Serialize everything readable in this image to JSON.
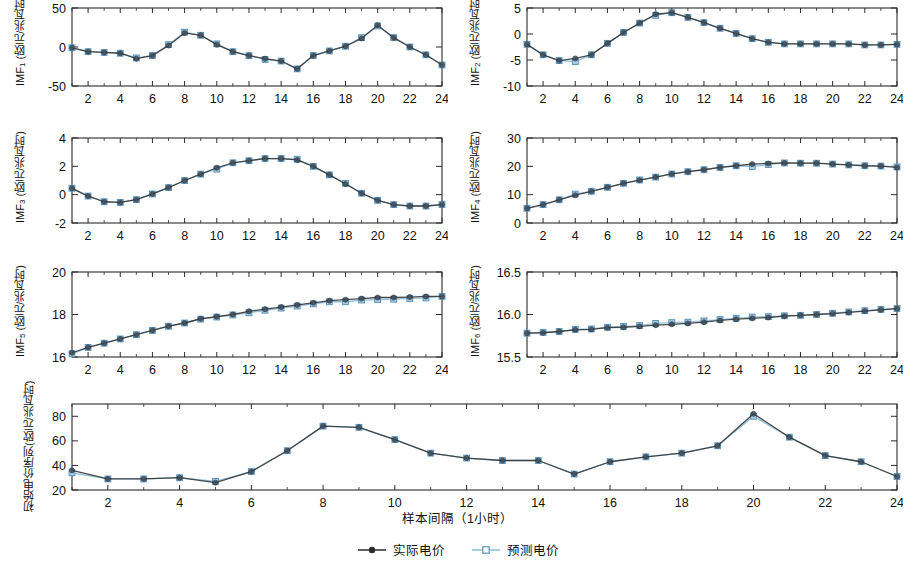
{
  "figure": {
    "xlabel": "样本间隔（1小时）",
    "units": "(欧元/兆瓦时)",
    "legend": [
      {
        "name": "actual-series",
        "label": "实际电价",
        "color": "#2b2b2b",
        "marker": "filled-circle"
      },
      {
        "name": "predicted-series",
        "label": "预测电价",
        "color": "#7fb4d8",
        "marker": "open-square"
      }
    ],
    "colors": {
      "actual_line": "#3a3a3a",
      "predicted_line": "#8fc0de",
      "predicted_marker_fill": "#a9cde6",
      "predicted_marker_edge": "#5b94bd",
      "axis": "#2b2b2b",
      "background": "#ffffff"
    }
  },
  "chart_data": [
    {
      "type": "line",
      "panel": "imf1",
      "title": "",
      "ylabel": "IMF₁ (欧元/兆瓦时)",
      "ylabel_base": "IMF",
      "ylabel_sub": "1",
      "ylabel_unit": " (欧元/兆瓦时)",
      "xlabel": "",
      "xlim": [
        1,
        24
      ],
      "ylim": [
        -50,
        50
      ],
      "yticks": [
        -50,
        0,
        50
      ],
      "ytick_labels": [
        "-50",
        "0",
        "50"
      ],
      "xticks": [
        2,
        4,
        6,
        8,
        10,
        12,
        14,
        16,
        18,
        20,
        22,
        24
      ],
      "grid": false,
      "x": [
        1,
        2,
        3,
        4,
        5,
        6,
        7,
        8,
        9,
        10,
        11,
        12,
        13,
        14,
        15,
        16,
        17,
        18,
        19,
        20,
        21,
        22,
        23,
        24
      ],
      "series": [
        {
          "name": "实际电价",
          "values": [
            -1,
            -6,
            -7,
            -8,
            -15,
            -11,
            2,
            18,
            15,
            3,
            -6,
            -11,
            -15,
            -18,
            -28,
            -11,
            -5,
            1,
            11,
            28,
            12,
            0,
            -10,
            -23
          ]
        },
        {
          "name": "预测电价",
          "values": [
            -1,
            -6,
            -7,
            -8,
            -14,
            -11,
            3,
            19,
            15,
            4,
            -6,
            -11,
            -16,
            -18,
            -28,
            -11,
            -5,
            1,
            12,
            27,
            12,
            0,
            -10,
            -23
          ]
        }
      ]
    },
    {
      "type": "line",
      "panel": "imf2",
      "ylabel": "IMF₂ (欧元/兆瓦时)",
      "ylabel_base": "IMF",
      "ylabel_sub": "2",
      "ylabel_unit": " (欧元/兆瓦时)",
      "xlim": [
        1,
        24
      ],
      "ylim": [
        -10,
        5
      ],
      "yticks": [
        -10,
        -5,
        0,
        5
      ],
      "ytick_labels": [
        "-10",
        "-5",
        "0",
        "5"
      ],
      "xticks": [
        2,
        4,
        6,
        8,
        10,
        12,
        14,
        16,
        18,
        20,
        22,
        24
      ],
      "grid": false,
      "x": [
        1,
        2,
        3,
        4,
        5,
        6,
        7,
        8,
        9,
        10,
        11,
        12,
        13,
        14,
        15,
        16,
        17,
        18,
        19,
        20,
        21,
        22,
        23,
        24
      ],
      "series": [
        {
          "name": "实际电价",
          "values": [
            -2.0,
            -4.0,
            -5.1,
            -4.7,
            -4.0,
            -1.8,
            0.3,
            2.1,
            3.8,
            4.1,
            3.2,
            2.2,
            1.1,
            0.1,
            -0.9,
            -1.6,
            -1.9,
            -1.9,
            -1.9,
            -1.9,
            -1.9,
            -2.1,
            -2.1,
            -2.0
          ]
        },
        {
          "name": "预测电价",
          "values": [
            -2.0,
            -4.0,
            -5.1,
            -5.3,
            -4.0,
            -1.8,
            0.3,
            2.1,
            3.6,
            4.1,
            3.2,
            2.2,
            1.1,
            0.1,
            -0.9,
            -1.6,
            -1.9,
            -1.9,
            -1.9,
            -1.9,
            -1.9,
            -2.1,
            -2.1,
            -2.0
          ]
        }
      ]
    },
    {
      "type": "line",
      "panel": "imf3",
      "ylabel": "IMF₃ (欧元/兆瓦时)",
      "ylabel_base": "IMF",
      "ylabel_sub": "3",
      "ylabel_unit": " (欧元/兆瓦时)",
      "xlim": [
        1,
        24
      ],
      "ylim": [
        -2,
        4
      ],
      "yticks": [
        -2,
        0,
        2,
        4
      ],
      "ytick_labels": [
        "-2",
        "0",
        "2",
        "4"
      ],
      "xticks": [
        2,
        4,
        6,
        8,
        10,
        12,
        14,
        16,
        18,
        20,
        22,
        24
      ],
      "grid": false,
      "x": [
        1,
        2,
        3,
        4,
        5,
        6,
        7,
        8,
        9,
        10,
        11,
        12,
        13,
        14,
        15,
        16,
        17,
        18,
        19,
        20,
        21,
        22,
        23,
        24
      ],
      "series": [
        {
          "name": "实际电价",
          "values": [
            0.45,
            -0.1,
            -0.5,
            -0.55,
            -0.35,
            0.05,
            0.5,
            1.0,
            1.45,
            1.9,
            2.25,
            2.4,
            2.55,
            2.55,
            2.45,
            2.0,
            1.4,
            0.75,
            0.1,
            -0.4,
            -0.7,
            -0.8,
            -0.8,
            -0.7
          ]
        },
        {
          "name": "预测电价",
          "values": [
            0.45,
            -0.1,
            -0.5,
            -0.55,
            -0.35,
            0.05,
            0.5,
            1.0,
            1.45,
            1.8,
            2.25,
            2.4,
            2.55,
            2.55,
            2.5,
            2.0,
            1.4,
            0.8,
            0.1,
            -0.4,
            -0.7,
            -0.8,
            -0.8,
            -0.7
          ]
        }
      ]
    },
    {
      "type": "line",
      "panel": "imf4",
      "ylabel": "IMF₄ (欧元/兆瓦时)",
      "ylabel_base": "IMF",
      "ylabel_sub": "4",
      "ylabel_unit": " (欧元/兆瓦时)",
      "xlim": [
        1,
        24
      ],
      "ylim": [
        0,
        30
      ],
      "yticks": [
        0,
        10,
        20,
        30
      ],
      "ytick_labels": [
        "0",
        "10",
        "20",
        "30"
      ],
      "xticks": [
        2,
        4,
        6,
        8,
        10,
        12,
        14,
        16,
        18,
        20,
        22,
        24
      ],
      "grid": false,
      "x": [
        1,
        2,
        3,
        4,
        5,
        6,
        7,
        8,
        9,
        10,
        11,
        12,
        13,
        14,
        15,
        16,
        17,
        18,
        19,
        20,
        21,
        22,
        23,
        24
      ],
      "series": [
        {
          "name": "实际电价",
          "values": [
            5.2,
            6.5,
            8.2,
            9.8,
            11.2,
            12.6,
            14.0,
            15.1,
            16.2,
            17.3,
            18.1,
            18.8,
            19.6,
            20.2,
            20.8,
            21.0,
            21.2,
            21.1,
            21.1,
            20.8,
            20.5,
            20.2,
            20.1,
            19.6
          ]
        },
        {
          "name": "预测电价",
          "values": [
            5.2,
            6.5,
            8.2,
            10.2,
            11.2,
            12.6,
            14.0,
            15.2,
            16.2,
            17.3,
            18.1,
            18.8,
            19.6,
            20.2,
            19.9,
            20.6,
            21.2,
            21.1,
            21.1,
            20.8,
            20.5,
            20.2,
            20.1,
            19.8
          ]
        }
      ]
    },
    {
      "type": "line",
      "panel": "imf5",
      "ylabel": "IMF₅ (欧元/兆瓦时)",
      "ylabel_base": "IMF",
      "ylabel_sub": "5",
      "ylabel_unit": " (欧元/兆瓦时)",
      "xlim": [
        1,
        24
      ],
      "ylim": [
        16,
        20
      ],
      "yticks": [
        16,
        18,
        20
      ],
      "ytick_labels": [
        "16",
        "18",
        "20"
      ],
      "xticks": [
        2,
        4,
        6,
        8,
        10,
        12,
        14,
        16,
        18,
        20,
        22,
        24
      ],
      "grid": false,
      "x": [
        1,
        2,
        3,
        4,
        5,
        6,
        7,
        8,
        9,
        10,
        11,
        12,
        13,
        14,
        15,
        16,
        17,
        18,
        19,
        20,
        21,
        22,
        23,
        24
      ],
      "series": [
        {
          "name": "实际电价",
          "values": [
            16.2,
            16.45,
            16.65,
            16.85,
            17.05,
            17.25,
            17.45,
            17.6,
            17.8,
            17.9,
            18.0,
            18.15,
            18.25,
            18.35,
            18.45,
            18.55,
            18.65,
            18.7,
            18.75,
            18.8,
            18.8,
            18.82,
            18.85,
            18.85
          ]
        },
        {
          "name": "预测电价",
          "values": [
            16.15,
            16.45,
            16.65,
            16.85,
            17.05,
            17.25,
            17.45,
            17.6,
            17.78,
            17.88,
            17.98,
            18.08,
            18.2,
            18.3,
            18.4,
            18.5,
            18.6,
            18.6,
            18.68,
            18.7,
            18.72,
            18.75,
            18.78,
            18.85
          ]
        }
      ]
    },
    {
      "type": "line",
      "panel": "imf6",
      "ylabel": "IMF₆ (欧元/兆瓦时)",
      "ylabel_base": "IMF",
      "ylabel_sub": "6",
      "ylabel_unit": " (欧元/兆瓦时)",
      "xlim": [
        1,
        24
      ],
      "ylim": [
        15.5,
        16.5
      ],
      "yticks": [
        15.5,
        16.0,
        16.5
      ],
      "ytick_labels": [
        "15.5",
        "16.0",
        "16.5"
      ],
      "xticks": [
        2,
        4,
        6,
        8,
        10,
        12,
        14,
        16,
        18,
        20,
        22,
        24
      ],
      "grid": false,
      "x": [
        1,
        2,
        3,
        4,
        5,
        6,
        7,
        8,
        9,
        10,
        11,
        12,
        13,
        14,
        15,
        16,
        17,
        18,
        19,
        20,
        21,
        22,
        23,
        24
      ],
      "series": [
        {
          "name": "实际电价",
          "values": [
            15.78,
            15.785,
            15.8,
            15.82,
            15.825,
            15.845,
            15.85,
            15.86,
            15.875,
            15.885,
            15.895,
            15.91,
            15.93,
            15.945,
            15.955,
            15.965,
            15.98,
            15.99,
            16.0,
            16.01,
            16.025,
            16.04,
            16.055,
            16.07
          ]
        },
        {
          "name": "预测电价",
          "values": [
            15.78,
            15.79,
            15.8,
            15.825,
            15.83,
            15.85,
            15.86,
            15.87,
            15.895,
            15.905,
            15.91,
            15.925,
            15.94,
            15.955,
            15.97,
            15.975,
            15.985,
            15.99,
            16.0,
            16.015,
            16.03,
            16.045,
            16.06,
            16.07
          ]
        }
      ]
    },
    {
      "type": "line",
      "panel": "original",
      "ylabel": "初始电价序列 (欧元/兆瓦时)",
      "ylabel_line1": "初始电价序列",
      "ylabel_line2": "(欧元/兆瓦时)",
      "xlabel": "样本间隔（1小时）",
      "xlim": [
        1,
        24
      ],
      "ylim": [
        20,
        90
      ],
      "yticks": [
        20,
        40,
        60,
        80
      ],
      "ytick_labels": [
        "20",
        "40",
        "60",
        "80"
      ],
      "xticks": [
        2,
        4,
        6,
        8,
        10,
        12,
        14,
        16,
        18,
        20,
        22,
        24
      ],
      "grid": false,
      "x": [
        1,
        2,
        3,
        4,
        5,
        6,
        7,
        8,
        9,
        10,
        11,
        12,
        13,
        14,
        15,
        16,
        17,
        18,
        19,
        20,
        21,
        22,
        23,
        24
      ],
      "series": [
        {
          "name": "实际电价",
          "values": [
            36,
            29,
            29,
            30,
            26,
            35,
            52,
            72,
            71,
            61,
            50,
            46,
            44,
            44,
            33,
            43,
            47,
            50,
            56,
            82,
            63,
            48,
            43,
            31
          ]
        },
        {
          "name": "预测电价",
          "values": [
            34,
            29,
            29,
            30,
            27,
            35,
            52,
            72,
            71,
            61,
            50,
            46,
            44,
            44,
            33,
            43,
            47,
            50,
            56,
            80,
            63,
            48,
            43,
            31
          ]
        }
      ]
    }
  ]
}
